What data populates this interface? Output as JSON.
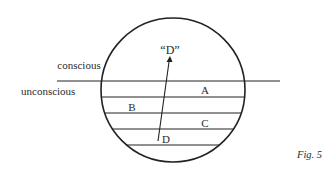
{
  "diagram": {
    "type": "layered-circle",
    "labels": {
      "conscious": "conscious",
      "unconscious": "unconscious",
      "layer_a": "A",
      "layer_b": "B",
      "layer_c": "C",
      "layer_d": "D",
      "emerged_d": "“D”"
    },
    "caption": "Fig. 5",
    "colors": {
      "stroke": "#222222",
      "background": "#ffffff"
    }
  }
}
